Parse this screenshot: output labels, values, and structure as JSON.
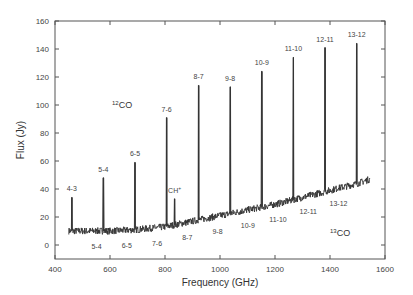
{
  "chart_data": {
    "type": "line",
    "title": "",
    "xlabel": "Frequency (GHz)",
    "ylabel": "Flux (Jy)",
    "xlim": [
      400,
      1600
    ],
    "ylim": [
      -10,
      160
    ],
    "xticks": [
      400,
      600,
      800,
      1000,
      1200,
      1400,
      1600
    ],
    "yticks": [
      0,
      20,
      40,
      60,
      80,
      100,
      120,
      140,
      160
    ],
    "grid": false,
    "annotations": {
      "co12_label": "CO",
      "co12_sup": "12",
      "co13_label": "CO",
      "co13_sup": "13",
      "ch_plus_label": "CH",
      "ch_plus_sup": "+"
    },
    "continuum": [
      {
        "x": 450,
        "y": 10
      },
      {
        "x": 600,
        "y": 10
      },
      {
        "x": 700,
        "y": 11
      },
      {
        "x": 800,
        "y": 13
      },
      {
        "x": 900,
        "y": 17
      },
      {
        "x": 1000,
        "y": 21
      },
      {
        "x": 1100,
        "y": 25
      },
      {
        "x": 1200,
        "y": 29
      },
      {
        "x": 1300,
        "y": 34
      },
      {
        "x": 1400,
        "y": 39
      },
      {
        "x": 1500,
        "y": 44
      },
      {
        "x": 1545,
        "y": 47
      }
    ],
    "series": [
      {
        "name": "12CO lines",
        "peaks": [
          {
            "label": "4-3",
            "x": 461,
            "y": 34
          },
          {
            "label": "5-4",
            "x": 576,
            "y": 48
          },
          {
            "label": "6-5",
            "x": 691,
            "y": 59
          },
          {
            "label": "7-6",
            "x": 806,
            "y": 91
          },
          {
            "label": "8-7",
            "x": 922,
            "y": 114
          },
          {
            "label": "9-8",
            "x": 1037,
            "y": 113
          },
          {
            "label": "10-9",
            "x": 1152,
            "y": 124
          },
          {
            "label": "11-10",
            "x": 1267,
            "y": 134
          },
          {
            "label": "12-11",
            "x": 1382,
            "y": 141
          },
          {
            "label": "13-12",
            "x": 1497,
            "y": 144
          }
        ]
      },
      {
        "name": "13CO lines",
        "peaks": [
          {
            "label": "5-4",
            "x": 551,
            "y": 11
          },
          {
            "label": "6-5",
            "x": 661,
            "y": 12
          },
          {
            "label": "7-6",
            "x": 771,
            "y": 13
          },
          {
            "label": "8-7",
            "x": 881,
            "y": 16
          },
          {
            "label": "9-8",
            "x": 991,
            "y": 20
          },
          {
            "label": "10-9",
            "x": 1101,
            "y": 25
          },
          {
            "label": "11-10",
            "x": 1211,
            "y": 30
          },
          {
            "label": "12-11",
            "x": 1321,
            "y": 35
          },
          {
            "label": "13-12",
            "x": 1431,
            "y": 40
          }
        ]
      },
      {
        "name": "CH+",
        "peaks": [
          {
            "label": "CH+",
            "x": 835,
            "y": 33
          }
        ]
      }
    ]
  }
}
